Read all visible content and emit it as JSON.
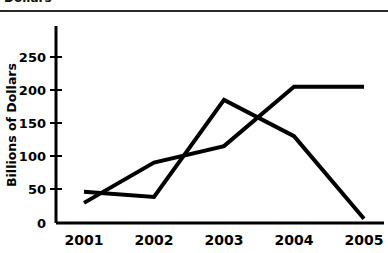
{
  "header": {
    "clipped_title": "Dollars"
  },
  "chart_data": {
    "type": "line",
    "title": "",
    "subtitle": "",
    "xlabel": "",
    "ylabel": "Billions of Dollars",
    "categories": [
      "2001",
      "2002",
      "2003",
      "2004",
      "2005"
    ],
    "x": [
      2001,
      2002,
      2003,
      2004,
      2005
    ],
    "ylim": [
      0,
      285
    ],
    "xlim": [
      2000.7,
      2005.35
    ],
    "yticks": [
      0,
      50,
      100,
      150,
      200,
      250
    ],
    "ytick_labels": [
      "0",
      "50",
      "100",
      "150",
      "200",
      "250"
    ],
    "xtick_labels": [
      "2001",
      "2002",
      "2003",
      "2004",
      "2005"
    ],
    "grid": false,
    "legend": "none",
    "series": [
      {
        "name": "series-1",
        "values": [
          46,
          38,
          185,
          130,
          5
        ],
        "color": "#000000"
      },
      {
        "name": "series-2",
        "values": [
          29,
          90,
          115,
          205,
          205
        ],
        "color": "#000000"
      }
    ],
    "line_color": "#000000",
    "line_width": 4,
    "axis_color": "#000000",
    "background": "#ffffff"
  }
}
